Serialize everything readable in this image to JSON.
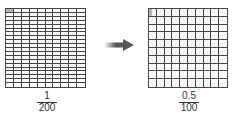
{
  "diagram": {
    "left_grid": {
      "columns": 10,
      "rows": 20,
      "shaded_cells": 1,
      "shade_fraction": 1
    },
    "right_grid": {
      "columns": 10,
      "rows": 10,
      "shaded_cells": 1,
      "shade_fraction": 0.5
    },
    "left_label": {
      "numerator": "1",
      "denominator": "200"
    },
    "right_label": {
      "numerator": "0.5",
      "denominator": "100"
    },
    "arrow": {
      "icon": "right-arrow-icon",
      "color": "#555555"
    },
    "colors": {
      "grid_line": "#444444",
      "shade": "#b8b8b8"
    }
  }
}
